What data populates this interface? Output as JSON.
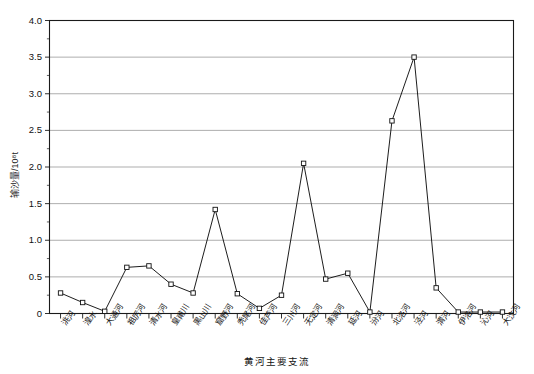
{
  "chart_data": {
    "type": "line",
    "title": "",
    "subtitle": "",
    "xlabel": "黄河主要支流",
    "ylabel": "输沙量/10⁸t",
    "ylim": [
      0,
      4.0
    ],
    "yticks": [
      "0",
      "0.5",
      "1.0",
      "1.5",
      "2.0",
      "2.5",
      "3.0",
      "3.5",
      "4.0"
    ],
    "ytick_values": [
      0,
      0.5,
      1.0,
      1.5,
      2.0,
      2.5,
      3.0,
      3.5,
      4.0
    ],
    "grid": "horizontal",
    "legend": "none",
    "marker": "open-square",
    "line_color": "#111111",
    "grid_color": "#8a8a8a",
    "categories": [
      "洮河",
      "湟水",
      "大通河",
      "祖厉河",
      "清水河",
      "皇甫川",
      "黑山川",
      "窟野河",
      "秃尾河",
      "佳芦河",
      "三川河",
      "无定河",
      "清涧河",
      "延河",
      "汾河",
      "北洛河",
      "泾河",
      "渭河",
      "伊洛河",
      "沁河",
      "大汶河"
    ],
    "values": [
      0.28,
      0.15,
      0.03,
      0.63,
      0.65,
      0.4,
      0.28,
      1.42,
      0.27,
      0.07,
      0.25,
      2.05,
      0.47,
      0.55,
      0.02,
      2.63,
      3.5,
      0.35,
      0.02,
      0.02,
      0.02
    ]
  },
  "axes": {
    "y_axis_label": "输沙量/10⁸t",
    "x_axis_label": "黄河主要支流"
  }
}
